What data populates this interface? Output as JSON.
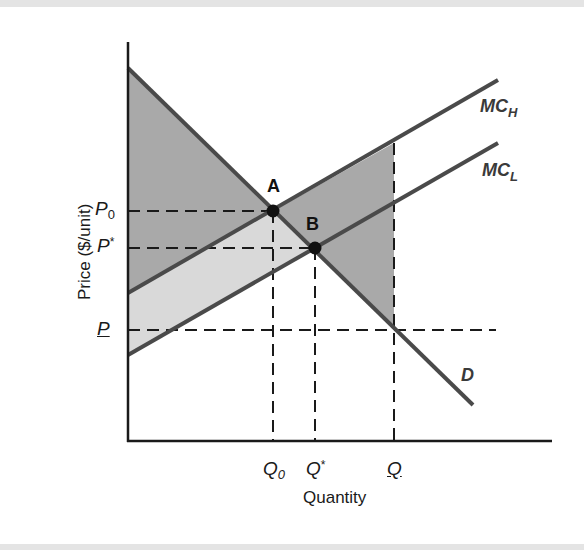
{
  "diagram": {
    "type": "supply-demand-marginal-cost",
    "colors": {
      "axis": "#1a1a1a",
      "curve": "#4a4a4a",
      "dashed": "#1a1a1a",
      "dark_shade": "#a9a9a9",
      "light_shade": "#d9d9d9",
      "point": "#111111"
    },
    "axes": {
      "x_label": "Quantity",
      "y_label": "Price ($/unit)"
    },
    "price_ticks": [
      {
        "id": "p0",
        "base": "P",
        "sub": "0",
        "sup": ""
      },
      {
        "id": "pstar",
        "base": "P",
        "sub": "",
        "sup": "*"
      },
      {
        "id": "pbar",
        "base": "P",
        "sub": "",
        "sup": "",
        "underlined": true
      }
    ],
    "quantity_ticks": [
      {
        "id": "q0",
        "base": "Q",
        "sub": "0",
        "sup": ""
      },
      {
        "id": "qstar",
        "base": "Q",
        "sub": "",
        "sup": "*"
      },
      {
        "id": "qbar",
        "base": "Q",
        "sub": "",
        "sup": "",
        "underlined": true
      }
    ],
    "curves": [
      {
        "id": "mch",
        "base": "MC",
        "sub": "H"
      },
      {
        "id": "mcl",
        "base": "MC",
        "sub": "L"
      },
      {
        "id": "demand",
        "base": "D",
        "sub": ""
      }
    ],
    "points": [
      {
        "id": "A",
        "label": "A"
      },
      {
        "id": "B",
        "label": "B"
      }
    ]
  }
}
